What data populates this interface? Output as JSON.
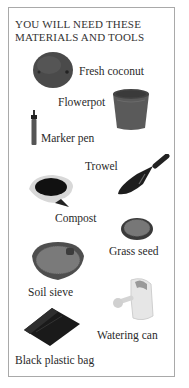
{
  "page": {
    "title_line1": "YOU WILL NEED THESE",
    "title_line2": "MATERIALS AND TOOLS"
  },
  "items": [
    {
      "label": "Fresh coconut",
      "icon": "coconut-icon"
    },
    {
      "label": "Flowerpot",
      "icon": "flowerpot-icon"
    },
    {
      "label": "Marker pen",
      "icon": "marker-pen-icon"
    },
    {
      "label": "Trowel",
      "icon": "trowel-icon"
    },
    {
      "label": "Compost",
      "icon": "compost-icon"
    },
    {
      "label": "Grass seed",
      "icon": "grass-seed-icon"
    },
    {
      "label": "Soil sieve",
      "icon": "soil-sieve-icon"
    },
    {
      "label": "Watering can",
      "icon": "watering-can-icon"
    },
    {
      "label": "Black plastic bag",
      "icon": "plastic-bag-icon"
    }
  ],
  "colors": {
    "border": "#a9a9a9",
    "text": "#2a2a2a"
  }
}
